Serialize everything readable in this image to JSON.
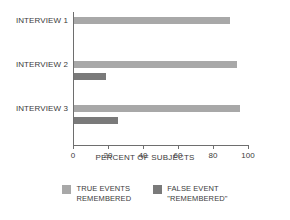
{
  "credit": "BRYAN CHRISTIE",
  "chart_data": {
    "type": "bar",
    "orientation": "horizontal",
    "title": "",
    "xlabel": "PERCENT OF SUBJECTS",
    "ylabel": "",
    "xlim": [
      0,
      100
    ],
    "grid": false,
    "legend_position": "bottom",
    "categories": [
      "INTERVIEW 1",
      "INTERVIEW 2",
      "INTERVIEW 3"
    ],
    "tick_labels": [
      "0",
      "20",
      "40",
      "60",
      "80",
      "100"
    ],
    "tick_values": [
      0,
      20,
      40,
      60,
      80,
      100
    ],
    "series": [
      {
        "name": "TRUE EVENTS REMEMBERED",
        "name_line1": "TRUE EVENTS",
        "name_line2": "REMEMBERED",
        "color": "#a8a8a8",
        "values": [
          89,
          93,
          95
        ]
      },
      {
        "name": "FALSE EVENT \"REMEMBERED\"",
        "name_line1": "FALSE EVENT",
        "name_line2": "\"REMEMBERED\"",
        "color": "#7a7a7a",
        "values": [
          null,
          18,
          25
        ]
      }
    ]
  }
}
